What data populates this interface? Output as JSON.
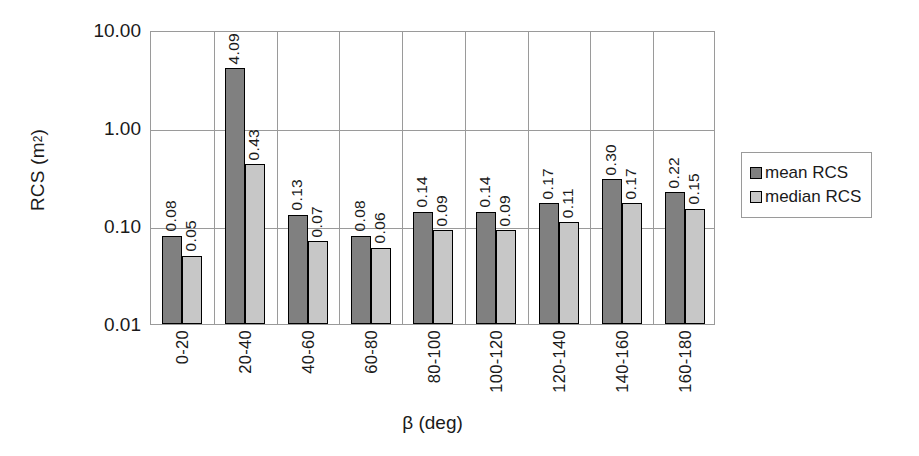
{
  "chart_data": {
    "type": "bar",
    "title": "",
    "xlabel": "β (deg)",
    "ylabel": "RCS (m²)",
    "yscale": "log",
    "ylim": [
      0.01,
      10.0
    ],
    "ytick_labels": [
      "10.00",
      "1.00",
      "0.10",
      "0.01"
    ],
    "ytick_values": [
      10.0,
      1.0,
      0.1,
      0.01
    ],
    "grid": "horizontal-and-vertical",
    "legend_position": "right-outside",
    "categories": [
      "0-20",
      "20-40",
      "40-60",
      "60-80",
      "80-100",
      "100-120",
      "120-140",
      "140-160",
      "160-180"
    ],
    "series": [
      {
        "name": "mean RCS",
        "color": "#808080",
        "values": [
          0.08,
          4.09,
          0.13,
          0.08,
          0.14,
          0.14,
          0.17,
          0.3,
          0.22
        ],
        "labels": [
          "0.08",
          "4.09",
          "0.13",
          "0.08",
          "0.14",
          "0.14",
          "0.17",
          "0.30",
          "0.22"
        ]
      },
      {
        "name": "median RCS",
        "color": "#c7c7c7",
        "values": [
          0.05,
          0.43,
          0.07,
          0.06,
          0.09,
          0.09,
          0.11,
          0.17,
          0.15
        ],
        "labels": [
          "0.05",
          "0.43",
          "0.07",
          "0.06",
          "0.09",
          "0.09",
          "0.11",
          "0.17",
          "0.15"
        ]
      }
    ]
  },
  "legend": {
    "entries": [
      {
        "label": "mean RCS",
        "color": "#808080"
      },
      {
        "label": "median RCS",
        "color": "#c7c7c7"
      }
    ]
  },
  "axes": {
    "y_title_main": "RCS (m",
    "y_title_sup": "2",
    "y_title_tail": ")",
    "x_title": "β (deg)"
  }
}
